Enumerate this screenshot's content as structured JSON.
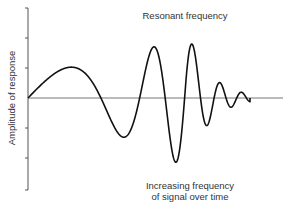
{
  "diagram": {
    "y_axis_label": "Amplitude of response",
    "top_annotation": "Resonant frequency",
    "bottom_annotation_line1": "Increasing frequency",
    "bottom_annotation_line2": "of signal over time",
    "colors": {
      "axis": "#555555",
      "wave": "#111111",
      "text": "#333333"
    }
  }
}
